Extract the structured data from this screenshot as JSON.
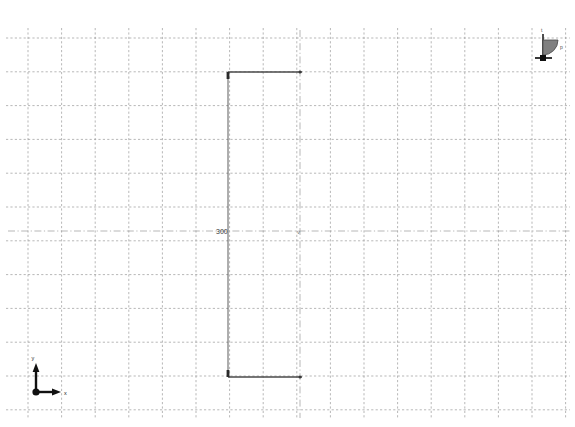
{
  "canvas": {
    "width": 575,
    "height": 427,
    "background_color": "#ffffff"
  },
  "grid": {
    "name": "construction-grid",
    "line_color": "#999999",
    "line_style": "dashed",
    "origin_x": 28,
    "origin_y": 38,
    "spacing_x": 33.6,
    "spacing_y": 33.8,
    "columns": 16,
    "rows": 11,
    "right_edge_x": 566,
    "bottom_edge_y": 410
  },
  "centerline": {
    "name": "horizontal-centerline",
    "y": 231,
    "x_start": 8,
    "x_end": 570,
    "color": "#9a9a9a",
    "style": "dash-dot"
  },
  "vertical_centerline": {
    "name": "vertical-centerline",
    "x": 300,
    "y_start": 30,
    "y_end": 418,
    "color": "#9a9a9a",
    "style": "dash-dot"
  },
  "dimension": {
    "name": "vertical-dimension-300",
    "label": "300",
    "label_x": 216,
    "label_y": 234,
    "line_x": 228,
    "line_y_top": 72,
    "line_y_bottom": 377,
    "extension_top_y": 72,
    "extension_bottom_y": 377,
    "extension_x_start": 228,
    "extension_x_end": 302,
    "color": "#4a4a4a",
    "arrow_style": "filled-tick"
  },
  "axis_indicator": {
    "name": "coordinate-axis-indicator",
    "origin_x": 36,
    "origin_y": 392,
    "x_label": "x",
    "y_label": "y",
    "x_arrow_length": 22,
    "y_arrow_length": 25,
    "color": "#111111"
  },
  "flag_symbol": {
    "name": "datum-flag-symbol",
    "pole_x": 543,
    "pole_top_y": 34,
    "pole_base_y": 58,
    "flag_fill": "#808080",
    "flag_stroke": "#4a4a4a",
    "base_color": "#1a1a1a",
    "top_label": "t",
    "side_label": "p",
    "side_label_x": 560,
    "side_label_y": 48
  },
  "point_marker": {
    "name": "vertex-point-marker",
    "x": 300,
    "y": 231,
    "glyph": "v",
    "color": "#777777"
  },
  "endpoint_markers": {
    "name": "line-endpoint-markers",
    "color": "#3a3a3a",
    "points": [
      {
        "x": 300,
        "y": 72
      },
      {
        "x": 300,
        "y": 377
      }
    ]
  }
}
